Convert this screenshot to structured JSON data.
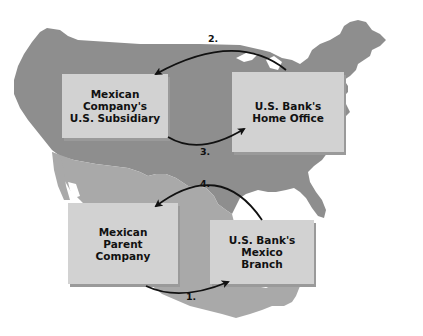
{
  "diagram": {
    "type": "flow-over-map",
    "background_map": {
      "regions": [
        {
          "name": "United States",
          "color": "#8e8e8e"
        },
        {
          "name": "Mexico",
          "color": "#a9a9a9"
        }
      ]
    },
    "boxes": [
      {
        "id": "us-subsidiary",
        "label": "Mexican Company's\nU.S. Subsidiary"
      },
      {
        "id": "us-bank-home",
        "label": "U.S. Bank's\nHome Office"
      },
      {
        "id": "mexican-parent",
        "label": "Mexican\nParent\nCompany"
      },
      {
        "id": "us-bank-mexico",
        "label": "U.S. Bank's\nMexico\nBranch"
      }
    ],
    "arrows": [
      {
        "step": "1.",
        "from": "mexican-parent",
        "to": "us-bank-mexico"
      },
      {
        "step": "2.",
        "from": "us-bank-home",
        "to": "us-subsidiary"
      },
      {
        "step": "3.",
        "from": "us-subsidiary",
        "to": "us-bank-home"
      },
      {
        "step": "4.",
        "from": "us-bank-mexico",
        "to": "mexican-parent"
      }
    ],
    "colors": {
      "box_fill": "#d2d2d2",
      "box_shadow": "#9a9a9a",
      "arrow": "#111111",
      "us_land": "#8e8e8e",
      "mexico_land": "#a9a9a9"
    }
  }
}
